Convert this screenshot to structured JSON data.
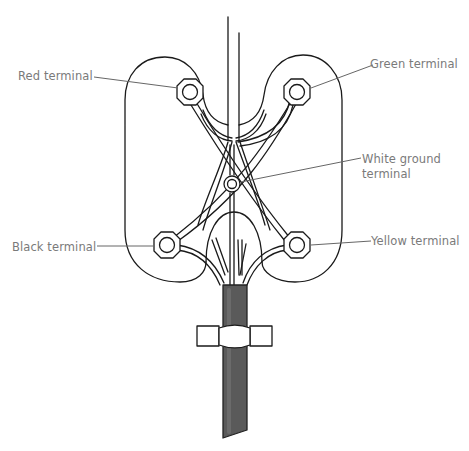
{
  "diagram": {
    "labels": {
      "red": "Red terminal",
      "green": "Green terminal",
      "white_line1": "White ground",
      "white_line2": "terminal",
      "black": "Black terminal",
      "yellow": "Yellow terminal"
    },
    "terminals": [
      {
        "name": "Red terminal",
        "x": 190,
        "y": 92
      },
      {
        "name": "Green terminal",
        "x": 297,
        "y": 92
      },
      {
        "name": "White ground terminal",
        "x": 232,
        "y": 184
      },
      {
        "name": "Black terminal",
        "x": 167,
        "y": 245
      },
      {
        "name": "Yellow terminal",
        "x": 297,
        "y": 245
      }
    ],
    "colors": {
      "line": "#1a1a1a",
      "leader": "#666666",
      "label": "#7a7a7a",
      "cable": "#5a5a5a",
      "background": "#ffffff"
    }
  }
}
